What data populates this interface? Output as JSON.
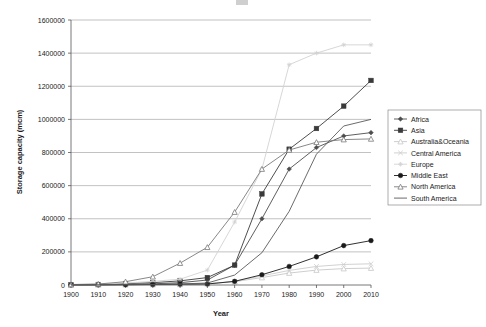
{
  "chart_data": {
    "type": "line",
    "title": "",
    "xlabel": "Year",
    "ylabel": "Storage capacity (mcm)",
    "x": [
      1900,
      1910,
      1920,
      1930,
      1940,
      1950,
      1960,
      1970,
      1980,
      1990,
      2000,
      2010
    ],
    "xticklabels": [
      "1900",
      "1910",
      "1920",
      "1930",
      "1940",
      "1950",
      "1960",
      "1970",
      "1980",
      "1990",
      "2000",
      "2010"
    ],
    "yticklabels": [
      "0",
      "200000",
      "400000",
      "600000",
      "800000",
      "1000000",
      "1200000",
      "1400000",
      "1600000"
    ],
    "yticks": [
      0,
      200000,
      400000,
      600000,
      800000,
      1000000,
      1200000,
      1400000,
      1600000
    ],
    "xlim": [
      1900,
      2010
    ],
    "ylim": [
      0,
      1600000
    ],
    "grid": "horizontal",
    "legend_position": "right",
    "series": [
      {
        "name": "Africa",
        "marker": "filled-diamond",
        "color": "#4d4d4d",
        "values": [
          1000,
          2000,
          4000,
          7000,
          14000,
          30000,
          120000,
          400000,
          700000,
          830000,
          900000,
          920000
        ]
      },
      {
        "name": "Asia",
        "marker": "filled-square",
        "color": "#3a3a3a",
        "values": [
          1500,
          3000,
          9000,
          14000,
          25000,
          45000,
          120000,
          550000,
          820000,
          945000,
          1080000,
          1235000
        ]
      },
      {
        "name": "Australia&Oceania",
        "marker": "open-triangle",
        "color": "#c8c8c8",
        "values": [
          500,
          900,
          1500,
          2500,
          4000,
          8000,
          20000,
          45000,
          72000,
          90000,
          99000,
          102000
        ]
      },
      {
        "name": "Central America",
        "marker": "cross",
        "color": "#cccccc",
        "values": [
          400,
          800,
          1400,
          2200,
          3500,
          7000,
          22000,
          55000,
          88000,
          112000,
          124000,
          128000
        ]
      },
      {
        "name": "Europe",
        "marker": "star",
        "color": "#d2d2d2",
        "values": [
          2000,
          5000,
          12000,
          22000,
          35000,
          90000,
          380000,
          700000,
          1330000,
          1400000,
          1450000,
          1450000
        ]
      },
      {
        "name": "Middle East",
        "marker": "filled-circle",
        "color": "#1a1a1a",
        "values": [
          800,
          1200,
          2000,
          3000,
          5000,
          6000,
          22000,
          62000,
          112000,
          170000,
          238000,
          268000
        ]
      },
      {
        "name": "North America",
        "marker": "open-triangle",
        "color": "#7a7a7a",
        "values": [
          3000,
          6000,
          20000,
          50000,
          132000,
          228000,
          440000,
          700000,
          815000,
          862000,
          878000,
          882000
        ]
      },
      {
        "name": "South America",
        "marker": "none",
        "color": "#5a5a5a",
        "values": [
          500,
          1000,
          2000,
          3500,
          6000,
          12000,
          60000,
          195000,
          445000,
          790000,
          960000,
          1000000
        ]
      }
    ]
  }
}
